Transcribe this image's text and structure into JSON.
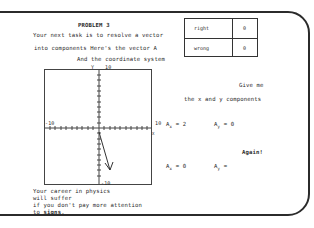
{
  "problem": {
    "title": "PROBLEM 3",
    "intro_line1": "Your next task is to resolve a vector",
    "intro_line2": "into components   Here's the vector A",
    "intro_line3": "And the coordinate system"
  },
  "score": {
    "rows": [
      {
        "label": "right",
        "value": "0"
      },
      {
        "label": "wrong",
        "value": "0"
      }
    ]
  },
  "graph": {
    "y_axis_label": "Y",
    "x_axis_label": "X",
    "y_max_label": "10",
    "y_min_label": "-10",
    "x_min_label": "-10",
    "x_max_label": "10",
    "vector": {
      "name": "A",
      "x": 2,
      "y": -7
    }
  },
  "prompt": {
    "line1": "Give me",
    "line2": "the x and y components"
  },
  "attempt1": {
    "ax_label": "A",
    "ax_sub": "x",
    "ax_value": "= 2",
    "ay_label": "A",
    "ay_sub": "y",
    "ay_value": "= 0"
  },
  "feedback": "Again!",
  "attempt2": {
    "ax_label": "A",
    "ax_sub": "x",
    "ax_value": "= 0",
    "ay_label": "A",
    "ay_sub": "y",
    "ay_value": "="
  },
  "footer": {
    "line1": "Your career in physics",
    "line2": "will suffer",
    "line3": "if you don't pay more attention",
    "line4_prefix": "to ",
    "line4_bold": "signs",
    "line4_suffix": "."
  }
}
